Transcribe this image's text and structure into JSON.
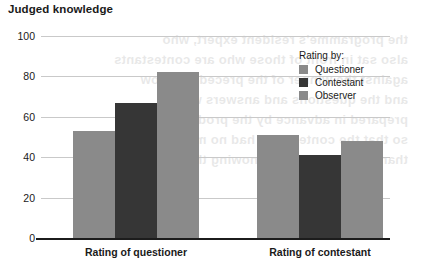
{
  "chart_data": {
    "type": "bar",
    "title": "Judged knowledge",
    "xlabel": "",
    "ylabel": "",
    "ylim": [
      0,
      100
    ],
    "yticks": [
      0,
      20,
      40,
      60,
      80,
      100
    ],
    "grid": true,
    "legend_position": "inside-top-right",
    "legend_title": "Rating by:",
    "categories": [
      "Rating of questioner",
      "Rating of contestant"
    ],
    "series": [
      {
        "name": "Questioner",
        "color": "#8a8a8a",
        "values": [
          53,
          51
        ]
      },
      {
        "name": "Contestant",
        "color": "#363636",
        "values": [
          67,
          41
        ]
      },
      {
        "name": "Observer",
        "color": "#8a8a8a",
        "values": [
          82,
          48
        ]
      }
    ]
  },
  "bleed_text": {
    "line1": "the programme's resident expert, who",
    "line2": "also sat in front of those who are contestants",
    "line3": "against the winner of the preceding show",
    "line4": "and the questions and answers were",
    "line5": "prepared in advance by the producers",
    "line6": "so that the contestants had no more chance",
    "line7": "than the observers of knowing them"
  }
}
